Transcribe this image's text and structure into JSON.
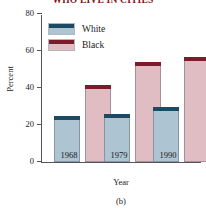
{
  "chart_data": {
    "type": "bar",
    "title": "WHO LIVE IN CITIES",
    "xlabel": "Year",
    "ylabel": "Percent",
    "categories": [
      "1968",
      "1979",
      "1990"
    ],
    "series": [
      {
        "name": "White",
        "values": [
          25,
          26,
          29.5
        ],
        "color": "#adc4d2",
        "cap_color": "#1d4a63"
      },
      {
        "name": "Black",
        "values": [
          41.5,
          54,
          56.5
        ],
        "color": "#e0bcc3",
        "cap_color": "#7d1b2b"
      }
    ],
    "ylim": [
      0,
      80
    ],
    "yticks": [
      "0",
      "20",
      "40",
      "60",
      "80"
    ],
    "ytick_values": [
      0,
      20,
      40,
      60,
      80
    ],
    "grid": false,
    "legend_position": "upper-left",
    "caption": "(b)",
    "title_color": "#7d1520"
  }
}
